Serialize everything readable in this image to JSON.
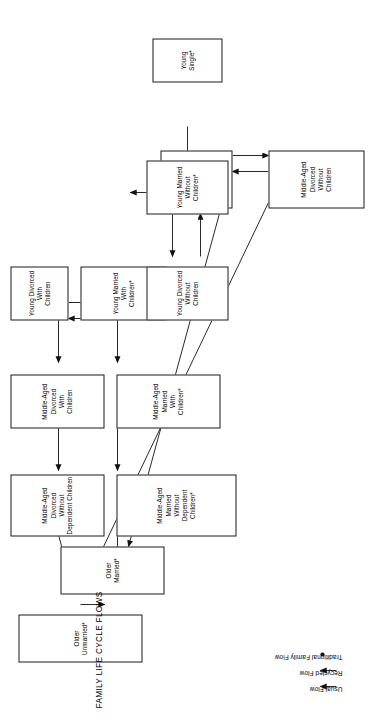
{
  "figure": {
    "title": "FAMILY LIFE CYCLE FLOWS",
    "orientation": "rotated-90-ccw",
    "background_color": "#ffffff",
    "line_color": "#1a1a1a"
  },
  "nodes": [
    {
      "id": "young-single",
      "label": "Young\nSingle*"
    },
    {
      "id": "young-married-without",
      "label": "Young Married\nWithout\nChildren*"
    },
    {
      "id": "young-divorced-without",
      "label": "Young Divorced\nWithout\nChildren"
    },
    {
      "id": "young-married-with",
      "label": "Young Married\nWith\nChildren*"
    },
    {
      "id": "young-divorced-with",
      "label": "Young Divorced\nWith\nChildren"
    },
    {
      "id": "mid-married-without",
      "label": "Middle-Aged Married\nWithout\nChildren"
    },
    {
      "id": "mid-divorced-without",
      "label": "Middle-Aged Divorced\nWithout\nChildren"
    },
    {
      "id": "mid-married-with",
      "label": "Middle-Aged Married\nWith\nChildren*"
    },
    {
      "id": "mid-divorced-with",
      "label": "Middle-Aged Divorced\nWith\nChildren"
    },
    {
      "id": "mid-married-no-dependent",
      "label": "Middle-Aged Married\nWithout\nDependent\nChildren*"
    },
    {
      "id": "mid-divorced-no-dependent",
      "label": "Middle-Aged Divorced\nWithout\nDependent Children"
    },
    {
      "id": "older-married",
      "label": "Older\nMarried*"
    },
    {
      "id": "older-unmarried",
      "label": "Older\nUnmarried*"
    }
  ],
  "legend": {
    "items": [
      {
        "id": "usual-flow",
        "label": "Usual Flow",
        "marker": "solid-arrow"
      },
      {
        "id": "recycled-flow",
        "label": "Recycled Flow",
        "marker": "solid-arrow"
      },
      {
        "id": "traditional-family-flow",
        "label": "Traditional Family Flow",
        "marker": "dot"
      }
    ]
  }
}
